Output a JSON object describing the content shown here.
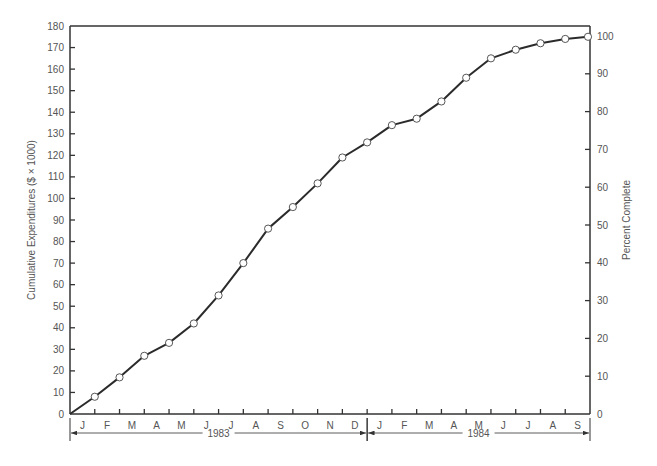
{
  "chart_data": {
    "type": "line",
    "title": "",
    "xlabel": "",
    "ylabel": "Cumulative Expenditures ($ × 1000)",
    "y2label": "Percent Complete",
    "ylim": [
      0,
      180
    ],
    "y2lim": [
      0,
      100
    ],
    "yticks": [
      0,
      10,
      20,
      30,
      40,
      50,
      60,
      70,
      80,
      90,
      100,
      110,
      120,
      130,
      140,
      150,
      160,
      170,
      180
    ],
    "y2ticks": [
      0,
      10,
      20,
      30,
      40,
      50,
      60,
      70,
      80,
      90,
      100
    ],
    "month_labels": [
      "J",
      "F",
      "M",
      "A",
      "M",
      "J",
      "J",
      "A",
      "S",
      "O",
      "N",
      "D",
      "J",
      "F",
      "M",
      "A",
      "M",
      "J",
      "J",
      "A",
      "S"
    ],
    "year_labels": [
      {
        "label": "1983",
        "start_month": 0,
        "end_month": 12
      },
      {
        "label": "1984",
        "start_month": 12,
        "end_month": 21
      }
    ],
    "grid": false,
    "marker": "open-circle",
    "x": [
      0,
      1,
      2,
      3,
      4,
      5,
      6,
      7,
      8,
      9,
      10,
      11,
      12,
      13,
      14,
      15,
      16,
      17,
      18,
      19,
      20,
      21
    ],
    "series": [
      {
        "name": "Cumulative Expenditures",
        "values": [
          0,
          8,
          17,
          27,
          33,
          42,
          55,
          70,
          86,
          96,
          107,
          119,
          126,
          134,
          137,
          145,
          156,
          165,
          169,
          172,
          174,
          175
        ]
      }
    ]
  },
  "colors": {
    "line": "#2b2b2b",
    "axis": "#333333",
    "text": "#555555",
    "marker_fill": "#ffffff"
  }
}
